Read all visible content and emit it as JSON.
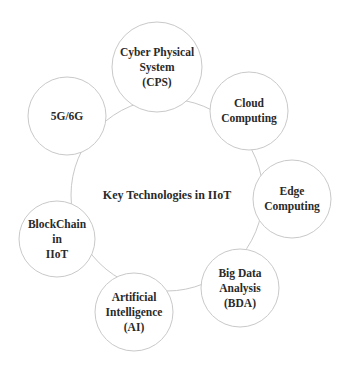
{
  "diagram": {
    "title": "Key Technologies in IIoT",
    "center": {
      "label": "Key Technologies in IIoT",
      "cx": 167,
      "cy": 195,
      "r": 96
    },
    "nodes": [
      {
        "id": "cps",
        "label": "Cyber Physical\nSystem\n(CPS)",
        "cx": 157,
        "cy": 67,
        "r": 45
      },
      {
        "id": "cloud",
        "label": "Cloud\nComputing",
        "cx": 249,
        "cy": 111,
        "r": 39
      },
      {
        "id": "edge",
        "label": "Edge\nComputing",
        "cx": 292,
        "cy": 199,
        "r": 39
      },
      {
        "id": "bda",
        "label": "Big Data\nAnalysis\n(BDA)",
        "cx": 240,
        "cy": 288,
        "r": 39
      },
      {
        "id": "ai",
        "label": "Artificial\nIntelligence\n(AI)",
        "cx": 134,
        "cy": 312,
        "r": 39
      },
      {
        "id": "blockchain",
        "label": "BlockChain\nin\nIIoT",
        "cx": 57,
        "cy": 239,
        "r": 38
      },
      {
        "id": "5g6g",
        "label": "5G/6G",
        "cx": 67,
        "cy": 116,
        "r": 39
      }
    ],
    "colors": {
      "stroke": "#c9c9c9",
      "fill": "#ffffff",
      "text": "#2a2a2a"
    }
  }
}
